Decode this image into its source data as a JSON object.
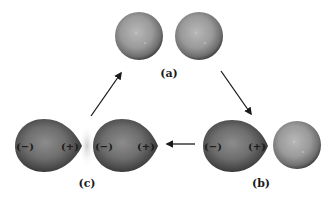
{
  "diagram": {
    "title": "",
    "panels": [
      {
        "id": "a",
        "label": "(a)",
        "description": "two non-polarized spherical atoms"
      },
      {
        "id": "b",
        "label": "(b)",
        "description": "instantaneous dipole forms in one atom next to a spherical atom"
      },
      {
        "id": "c",
        "label": "(c)",
        "description": "induced dipole in neighboring atom; attraction between dipoles"
      }
    ],
    "charges": {
      "negative": "(−)",
      "positive": "(+)"
    },
    "colors": {
      "sphere_light": "#b5b5b5",
      "sphere_dark": "#3a3a3a",
      "polarized_light": "#8a8a8a",
      "polarized_dark": "#222222",
      "arrow": "#1a1a1a",
      "background": "#ffffff"
    },
    "arrows": [
      {
        "from": "a",
        "to": "b",
        "direction": "down-right"
      },
      {
        "from": "b",
        "to": "c",
        "direction": "left"
      },
      {
        "from": "c",
        "to": "a",
        "direction": "up-right"
      }
    ]
  }
}
